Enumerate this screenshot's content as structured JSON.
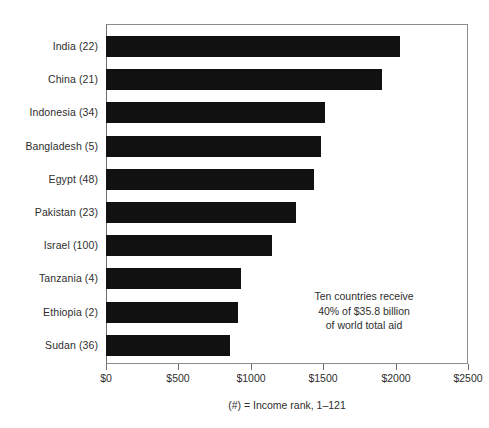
{
  "chart_data": {
    "type": "bar",
    "orientation": "horizontal",
    "title": "",
    "xlabel": "",
    "ylabel": "",
    "xlim": [
      0,
      2500
    ],
    "xticks": [
      0,
      500,
      1000,
      1500,
      2000,
      2500
    ],
    "xtick_labels": [
      "$0",
      "$500",
      "$1000",
      "$1500",
      "$2000",
      "$2500"
    ],
    "grid": false,
    "legend": null,
    "categories": [
      "India (22)",
      "China (21)",
      "Indonesia (34)",
      "Bangladesh (5)",
      "Egypt (48)",
      "Pakistan (23)",
      "Israel (100)",
      "Tanzania (4)",
      "Ethiopia (2)",
      "Sudan (36)"
    ],
    "values": [
      2030,
      1905,
      1510,
      1485,
      1435,
      1310,
      1145,
      930,
      910,
      855
    ],
    "annotations": [
      "Ten countries receive",
      "40% of $35.8 billion",
      "of world total aid"
    ],
    "caption": "(#) = Income rank, 1–121"
  },
  "colors": {
    "bar": "#111111",
    "frame": "#8c8c8c",
    "text": "#2e2e2e",
    "background": "#ffffff"
  }
}
